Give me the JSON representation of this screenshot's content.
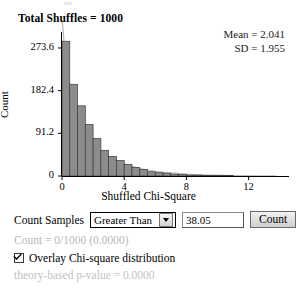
{
  "header": {
    "title": "Total Shuffles = 1000"
  },
  "stats": {
    "mean_label": "Mean = 2.041",
    "sd_label": "SD = 1.955"
  },
  "controls": {
    "count_samples_label": "Count Samples",
    "direction_value": "Greater Than",
    "direction_options": [
      "Greater Than",
      "Less Than",
      "Beyond",
      "Between"
    ],
    "threshold_value": "38.05",
    "count_button_label": "Count",
    "count_result": "Count = 0/1000 (0.0000)",
    "overlay_label": "Overlay Chi-square distribution",
    "overlay_checked": true,
    "theory_pvalue": "theory-based p-value = 0.0000"
  },
  "chart_data": {
    "type": "bar",
    "title": "Total Shuffles = 1000",
    "xlabel": "Shuffled Chi-Square",
    "ylabel": "Count",
    "xlim": [
      0,
      14.6
    ],
    "ylim": [
      0,
      312
    ],
    "grid": false,
    "legend": null,
    "xticks": [
      "0",
      "4",
      "8",
      "12"
    ],
    "xtick_values": [
      0,
      4,
      8,
      12
    ],
    "yticks": [
      "0",
      "91.2",
      "182.4",
      "273.6"
    ],
    "ytick_values": [
      0,
      91.2,
      182.4,
      273.6
    ],
    "bin_width": 0.5,
    "bin_starts": [
      0.0,
      0.5,
      1.0,
      1.5,
      2.0,
      2.5,
      3.0,
      3.5,
      4.0,
      4.5,
      5.0,
      5.5,
      6.0,
      6.5,
      7.0,
      7.5,
      8.0,
      8.5,
      9.0,
      9.5,
      10.0,
      10.5
    ],
    "values": [
      288,
      196,
      150,
      110,
      80,
      55,
      42,
      33,
      25,
      18,
      14,
      9,
      7,
      6,
      4,
      3,
      2,
      2,
      1,
      1,
      1,
      1
    ],
    "bar_fill": "#8c8c8c",
    "bar_stroke": "#3b3b3b",
    "overlay": {
      "name": "Chi-square distribution",
      "color": "#b9b9b9",
      "visible": true,
      "x": [
        0.02,
        0.1,
        0.2,
        0.3,
        0.45,
        0.6,
        0.8,
        1.0,
        1.3,
        1.6,
        2.0,
        2.4,
        2.9,
        3.4,
        4.0,
        4.6,
        5.2,
        6.0,
        6.8,
        7.6,
        8.5,
        9.5,
        10.5,
        11.5,
        12.6,
        13.8
      ],
      "y": [
        330,
        300,
        248,
        214,
        182,
        160,
        138,
        122,
        102,
        87,
        70,
        57,
        44,
        35,
        26,
        20,
        15,
        10,
        7,
        5,
        3.2,
        2.0,
        1.2,
        0.7,
        0.4,
        0.2
      ]
    }
  }
}
